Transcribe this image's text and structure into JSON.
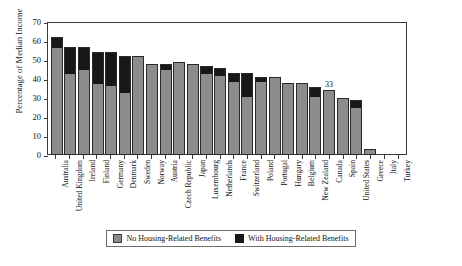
{
  "chart_data": {
    "type": "bar",
    "stacked": true,
    "title": "",
    "xlabel": "",
    "ylabel": "Percentage of Median Income",
    "ylim": [
      0,
      70
    ],
    "yticks": [
      0,
      10,
      20,
      30,
      40,
      50,
      60,
      70
    ],
    "grid": false,
    "legend_position": "bottom",
    "colors": {
      "no_housing_benefits": "#8c8c8c",
      "with_housing_benefits": "#181818",
      "axis": "#3a3a3a",
      "text": "#111111"
    },
    "categories": [
      "Australia",
      "United Kingdom",
      "Ireland",
      "Finland",
      "Germany",
      "Denmark",
      "Sweden",
      "Norway",
      "Austria",
      "Czech Republic",
      "Japan",
      "Luxembourg",
      "Netherlands",
      "France",
      "Switzerland",
      "Poland",
      "Portugal",
      "Hungary",
      "Belgium",
      "New Zealand",
      "Canada",
      "Spain",
      "United States",
      "Greece",
      "Italy",
      "Turkey"
    ],
    "series": [
      {
        "name": "No Housing-Related Benefits",
        "values": [
          56,
          42,
          44,
          37,
          36,
          32,
          51,
          47,
          44,
          48,
          47,
          42,
          41,
          38,
          30,
          38,
          40,
          37,
          37,
          30,
          33,
          29,
          24,
          2,
          0,
          0
        ]
      },
      {
        "name": "With Housing-Related Benefits",
        "values": [
          5,
          14,
          12,
          16,
          17,
          19,
          0,
          0,
          3,
          0,
          0,
          4,
          4,
          4,
          12,
          2,
          0,
          0,
          0,
          5,
          0,
          0,
          4,
          0,
          0,
          0
        ]
      }
    ],
    "totals": [
      61,
      56,
      56,
      53,
      53,
      51,
      51,
      47,
      47,
      48,
      47,
      46,
      45,
      42,
      42,
      40,
      40,
      37,
      37,
      35,
      33,
      29,
      28,
      2,
      0,
      0
    ],
    "data_labels": [
      {
        "category": "Canada",
        "value": "33"
      }
    ]
  },
  "legend": {
    "items": [
      {
        "label": "No Housing-Related Benefits",
        "swatch": "gray"
      },
      {
        "label": "With Housing-Related Benefits",
        "swatch": "black"
      }
    ]
  }
}
